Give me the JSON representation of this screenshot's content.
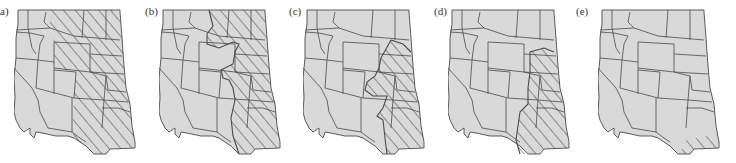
{
  "figure": {
    "colors": {
      "land": "#d9d9d9",
      "border": "#4a4a4a",
      "hatch": "#3a3a3a",
      "background": "#ffffff"
    },
    "panels": [
      {
        "id": "a",
        "label": "a)",
        "hatched_region": "Great Plains states east of the Rockies (MT/ND/SD/WY-east/NE/KS/CO-east/OK/TX)"
      },
      {
        "id": "b",
        "label": "(b)",
        "hatched_region": "Plains east of a wavy boundary through MT, WY, CO, NM; north-east MT excluded"
      },
      {
        "id": "c",
        "label": "(c)",
        "hatched_region": "Central Plains from SD/NE through KS, OK, TX"
      },
      {
        "id": "d",
        "label": "(d)",
        "hatched_region": "Eastern strip from SD/NE down through KS, OK, east TX"
      },
      {
        "id": "e",
        "label": "(e)",
        "hatched_region": "Small area along the southern Texas gulf coast"
      }
    ]
  }
}
